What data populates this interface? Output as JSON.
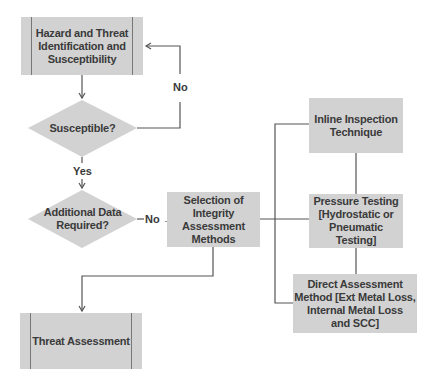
{
  "flowchart": {
    "nodes": {
      "hazard": {
        "label": "Hazard and Threat\nIdentification and\nSusceptibility",
        "shape": "predefined-process"
      },
      "susceptible": {
        "label": "Susceptible?",
        "shape": "decision"
      },
      "additional_data": {
        "label": "Additional Data\nRequired?",
        "shape": "decision"
      },
      "selection": {
        "label": "Selection of\nIntegrity\nAssessment\nMethods",
        "shape": "process"
      },
      "inline": {
        "label": "Inline Inspection\nTechnique",
        "shape": "process"
      },
      "pressure": {
        "label": "Pressure Testing\n[Hydrostatic or\nPneumatic Testing]",
        "shape": "process"
      },
      "direct": {
        "label": "Direct Assessment\nMethod [Ext Metal Loss,\nInternal Metal Loss\nand SCC]",
        "shape": "process"
      },
      "threat": {
        "label": "Threat Assessment",
        "shape": "predefined-process"
      }
    },
    "edges": {
      "susceptible_no": "No",
      "susceptible_yes": "Yes",
      "additional_no": "No →"
    },
    "colors": {
      "fill": "#d2d2d2",
      "text": "#3a3a3a",
      "line": "#555555"
    }
  }
}
